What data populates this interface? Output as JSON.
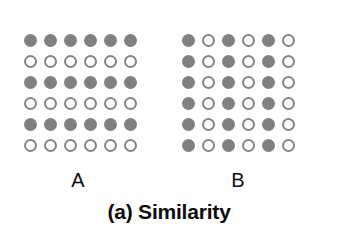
{
  "figure": {
    "caption": "(a) Similarity",
    "background_color": "#fefefe",
    "filled_color": "#808080",
    "open_stroke_color": "#858585",
    "open_fill_color": "#ffffff"
  },
  "panels": [
    {
      "id": "A",
      "label": "A",
      "grouping_principle": "rows",
      "rows": 6,
      "columns": 6,
      "pattern": [
        [
          "filled",
          "filled",
          "filled",
          "filled",
          "filled",
          "filled"
        ],
        [
          "open",
          "open",
          "open",
          "open",
          "open",
          "open"
        ],
        [
          "filled",
          "filled",
          "filled",
          "filled",
          "filled",
          "filled"
        ],
        [
          "open",
          "open",
          "open",
          "open",
          "open",
          "open"
        ],
        [
          "filled",
          "filled",
          "filled",
          "filled",
          "filled",
          "filled"
        ],
        [
          "open",
          "open",
          "open",
          "open",
          "open",
          "open"
        ]
      ]
    },
    {
      "id": "B",
      "label": "B",
      "grouping_principle": "columns",
      "rows": 6,
      "columns": 6,
      "pattern": [
        [
          "filled",
          "open",
          "filled",
          "open",
          "filled",
          "open"
        ],
        [
          "filled",
          "open",
          "filled",
          "open",
          "filled",
          "open"
        ],
        [
          "filled",
          "open",
          "filled",
          "open",
          "filled",
          "open"
        ],
        [
          "filled",
          "open",
          "filled",
          "open",
          "filled",
          "open"
        ],
        [
          "filled",
          "open",
          "filled",
          "open",
          "filled",
          "open"
        ],
        [
          "filled",
          "open",
          "filled",
          "open",
          "filled",
          "open"
        ]
      ]
    }
  ]
}
